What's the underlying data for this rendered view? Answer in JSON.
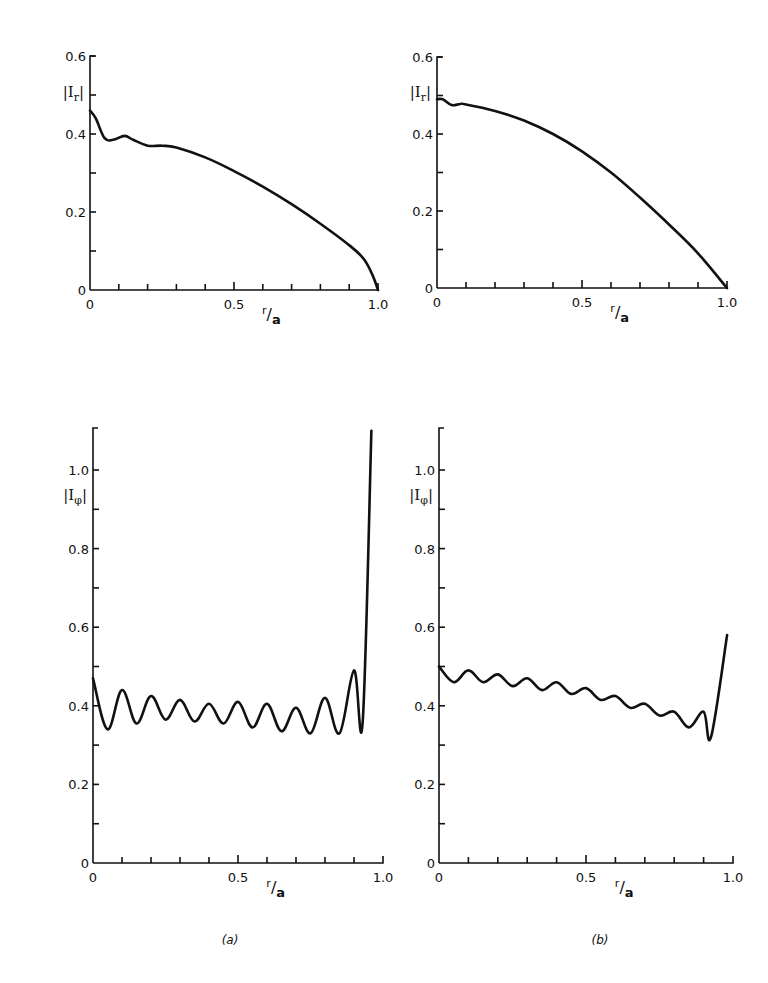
{
  "figure": {
    "captions": [
      "(a)",
      "(b)"
    ]
  },
  "chart_data": [
    {
      "id": "a-top",
      "type": "line",
      "panel": "(a)",
      "xlabel": "r/a",
      "ylabel": "|I_r|",
      "xlim": [
        0,
        1.0
      ],
      "ylim": [
        0,
        0.6
      ],
      "xticks": [
        "0",
        "0.5",
        "1.0"
      ],
      "yticks": [
        "0",
        "0.2",
        "0.4",
        "0.6"
      ],
      "x": [
        0,
        0.02,
        0.05,
        0.08,
        0.12,
        0.15,
        0.2,
        0.25,
        0.3,
        0.4,
        0.5,
        0.6,
        0.7,
        0.8,
        0.9,
        0.95,
        0.98,
        1.0
      ],
      "values": [
        0.46,
        0.44,
        0.39,
        0.385,
        0.395,
        0.385,
        0.37,
        0.37,
        0.365,
        0.34,
        0.305,
        0.265,
        0.22,
        0.17,
        0.115,
        0.08,
        0.04,
        0.0
      ]
    },
    {
      "id": "b-top",
      "type": "line",
      "panel": "(b)",
      "xlabel": "r/a",
      "ylabel": "|I_r|",
      "xlim": [
        0,
        1.0
      ],
      "ylim": [
        0,
        0.6
      ],
      "xticks": [
        "0",
        "0.5",
        "1.0"
      ],
      "yticks": [
        "0",
        "0.2",
        "0.4",
        "0.6"
      ],
      "x": [
        0,
        0.02,
        0.05,
        0.08,
        0.1,
        0.2,
        0.3,
        0.4,
        0.5,
        0.6,
        0.7,
        0.8,
        0.9,
        1.0
      ],
      "values": [
        0.49,
        0.49,
        0.475,
        0.478,
        0.477,
        0.46,
        0.435,
        0.4,
        0.355,
        0.3,
        0.235,
        0.165,
        0.09,
        0.0
      ]
    },
    {
      "id": "a-bottom",
      "type": "line",
      "panel": "(a)",
      "xlabel": "r/a",
      "ylabel": "|I_phi|",
      "xlim": [
        0,
        1.0
      ],
      "ylim": [
        0,
        1.1
      ],
      "xticks": [
        "0",
        "0.5",
        "1.0"
      ],
      "yticks": [
        "0",
        "0.2",
        "0.4",
        "0.6",
        "0.8",
        "1.0"
      ],
      "x": [
        0,
        0.05,
        0.1,
        0.15,
        0.2,
        0.25,
        0.3,
        0.35,
        0.4,
        0.45,
        0.5,
        0.55,
        0.6,
        0.65,
        0.7,
        0.75,
        0.8,
        0.85,
        0.9,
        0.93,
        0.96
      ],
      "values": [
        0.47,
        0.34,
        0.44,
        0.355,
        0.425,
        0.365,
        0.415,
        0.36,
        0.405,
        0.355,
        0.41,
        0.345,
        0.405,
        0.335,
        0.395,
        0.33,
        0.42,
        0.33,
        0.49,
        0.36,
        1.1
      ]
    },
    {
      "id": "b-bottom",
      "type": "line",
      "panel": "(b)",
      "xlabel": "r/a",
      "ylabel": "|I_phi|",
      "xlim": [
        0,
        1.0
      ],
      "ylim": [
        0,
        1.1
      ],
      "xticks": [
        "0",
        "0.5",
        "1.0"
      ],
      "yticks": [
        "0",
        "0.2",
        "0.4",
        "0.6",
        "0.8",
        "1.0"
      ],
      "x": [
        0,
        0.05,
        0.1,
        0.15,
        0.2,
        0.25,
        0.3,
        0.35,
        0.4,
        0.45,
        0.5,
        0.55,
        0.6,
        0.65,
        0.7,
        0.75,
        0.8,
        0.85,
        0.9,
        0.925,
        0.98
      ],
      "values": [
        0.5,
        0.46,
        0.49,
        0.46,
        0.48,
        0.45,
        0.47,
        0.44,
        0.46,
        0.43,
        0.445,
        0.415,
        0.425,
        0.395,
        0.405,
        0.375,
        0.385,
        0.345,
        0.385,
        0.32,
        0.58
      ]
    }
  ]
}
